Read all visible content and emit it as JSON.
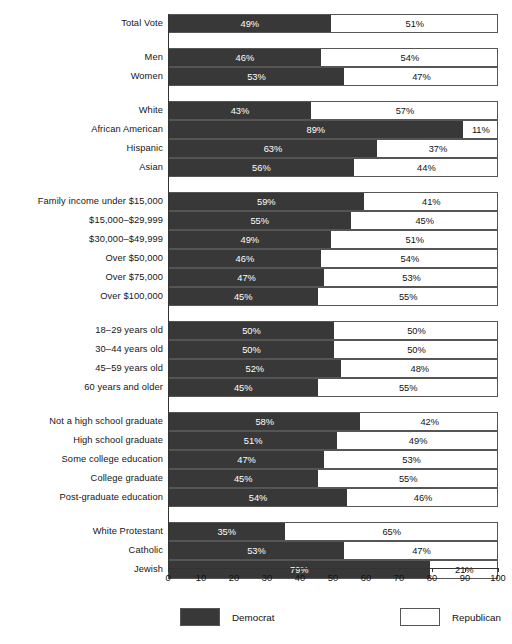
{
  "chart_data": {
    "type": "bar",
    "subtype": "stacked-horizontal-100",
    "title": "",
    "xlabel": "",
    "ylabel": "",
    "xlim": [
      0,
      100
    ],
    "xticks": [
      "0",
      "10",
      "20",
      "30",
      "40",
      "50",
      "60",
      "70",
      "80",
      "90",
      "100"
    ],
    "grid": false,
    "legend_position": "bottom",
    "series": [
      {
        "name": "Democrat",
        "color": "#383838"
      },
      {
        "name": "Republican",
        "color": "#ffffff"
      }
    ],
    "groups": [
      {
        "name": "total",
        "rows": [
          {
            "label": "Total Vote",
            "democrat": 49,
            "republican": 51,
            "democrat_text": "49%",
            "republican_text": "51%"
          }
        ]
      },
      {
        "name": "gender",
        "rows": [
          {
            "label": "Men",
            "democrat": 46,
            "republican": 54,
            "democrat_text": "46%",
            "republican_text": "54%"
          },
          {
            "label": "Women",
            "democrat": 53,
            "republican": 47,
            "democrat_text": "53%",
            "republican_text": "47%"
          }
        ]
      },
      {
        "name": "race",
        "rows": [
          {
            "label": "White",
            "democrat": 43,
            "republican": 57,
            "democrat_text": "43%",
            "republican_text": "57%"
          },
          {
            "label": "African American",
            "democrat": 89,
            "republican": 11,
            "democrat_text": "89%",
            "republican_text": "11%"
          },
          {
            "label": "Hispanic",
            "democrat": 63,
            "republican": 37,
            "democrat_text": "63%",
            "republican_text": "37%"
          },
          {
            "label": "Asian",
            "democrat": 56,
            "republican": 44,
            "democrat_text": "56%",
            "republican_text": "44%"
          }
        ]
      },
      {
        "name": "income",
        "rows": [
          {
            "label": "Family income under $15,000",
            "democrat": 59,
            "republican": 41,
            "democrat_text": "59%",
            "republican_text": "41%"
          },
          {
            "label": "$15,000–$29,999",
            "democrat": 55,
            "republican": 45,
            "democrat_text": "55%",
            "republican_text": "45%"
          },
          {
            "label": "$30,000–$49,999",
            "democrat": 49,
            "republican": 51,
            "democrat_text": "49%",
            "republican_text": "51%"
          },
          {
            "label": "Over $50,000",
            "democrat": 46,
            "republican": 54,
            "democrat_text": "46%",
            "republican_text": "54%"
          },
          {
            "label": "Over $75,000",
            "democrat": 47,
            "republican": 53,
            "democrat_text": "47%",
            "republican_text": "53%"
          },
          {
            "label": "Over $100,000",
            "democrat": 45,
            "republican": 55,
            "democrat_text": "45%",
            "republican_text": "55%"
          }
        ]
      },
      {
        "name": "age",
        "rows": [
          {
            "label": "18–29 years old",
            "democrat": 50,
            "republican": 50,
            "democrat_text": "50%",
            "republican_text": "50%"
          },
          {
            "label": "30–44 years old",
            "democrat": 50,
            "republican": 50,
            "democrat_text": "50%",
            "republican_text": "50%"
          },
          {
            "label": "45–59 years old",
            "democrat": 52,
            "republican": 48,
            "democrat_text": "52%",
            "republican_text": "48%"
          },
          {
            "label": "60 years and older",
            "democrat": 45,
            "republican": 55,
            "democrat_text": "45%",
            "republican_text": "55%"
          }
        ]
      },
      {
        "name": "education",
        "rows": [
          {
            "label": "Not a high school graduate",
            "democrat": 58,
            "republican": 42,
            "democrat_text": "58%",
            "republican_text": "42%"
          },
          {
            "label": "High school graduate",
            "democrat": 51,
            "republican": 49,
            "democrat_text": "51%",
            "republican_text": "49%"
          },
          {
            "label": "Some college education",
            "democrat": 47,
            "republican": 53,
            "democrat_text": "47%",
            "republican_text": "53%"
          },
          {
            "label": "College graduate",
            "democrat": 45,
            "republican": 55,
            "democrat_text": "45%",
            "republican_text": "55%"
          },
          {
            "label": "Post-graduate education",
            "democrat": 54,
            "republican": 46,
            "democrat_text": "54%",
            "republican_text": "46%"
          }
        ]
      },
      {
        "name": "religion",
        "rows": [
          {
            "label": "White Protestant",
            "democrat": 35,
            "republican": 65,
            "democrat_text": "35%",
            "republican_text": "65%"
          },
          {
            "label": "Catholic",
            "democrat": 53,
            "republican": 47,
            "democrat_text": "53%",
            "republican_text": "47%"
          },
          {
            "label": "Jewish",
            "democrat": 79,
            "republican": 21,
            "democrat_text": "79%",
            "republican_text": "21%"
          }
        ]
      }
    ]
  },
  "legend": {
    "democrat_label": "Democrat",
    "republican_label": "Republican"
  },
  "colors": {
    "democrat": "#383838",
    "republican": "#ffffff",
    "bar_border": "#555555",
    "text": "#161616"
  }
}
